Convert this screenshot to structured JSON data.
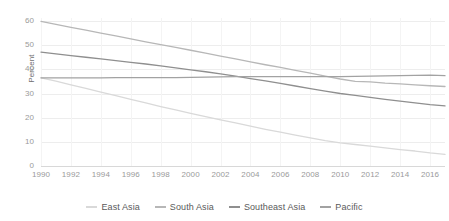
{
  "chart_data": {
    "type": "line",
    "title": "",
    "xlabel": "",
    "ylabel": "Percent",
    "xlim": [
      1990,
      2017
    ],
    "ylim": [
      0,
      60
    ],
    "grid": true,
    "legend_position": "bottom",
    "x_ticks": [
      "1990",
      "1992",
      "1994",
      "1996",
      "1998",
      "2000",
      "2002",
      "2004",
      "2006",
      "2008",
      "2010",
      "2012",
      "2014",
      "2016"
    ],
    "y_ticks": [
      "0",
      "10",
      "20",
      "30",
      "40",
      "50",
      "60"
    ],
    "x": [
      1990,
      1991,
      1992,
      1993,
      1994,
      1995,
      1996,
      1997,
      1998,
      1999,
      2000,
      2001,
      2002,
      2003,
      2004,
      2005,
      2006,
      2007,
      2008,
      2009,
      2010,
      2011,
      2012,
      2013,
      2014,
      2015,
      2016,
      2017
    ],
    "series": [
      {
        "name": "East Asia",
        "color": "#d9d9d9",
        "values": [
          36.5,
          35.1,
          33.6,
          32.1,
          30.6,
          29.1,
          27.6,
          26.1,
          24.6,
          23.2,
          21.8,
          20.4,
          19.1,
          17.8,
          16.5,
          15.2,
          14.0,
          12.8,
          11.6,
          10.5,
          9.6,
          8.9,
          8.2,
          7.5,
          6.8,
          6.2,
          5.4,
          4.8
        ]
      },
      {
        "name": "South Asia",
        "color": "#b7b7b7",
        "values": [
          59.8,
          58.6,
          57.4,
          56.2,
          55.0,
          53.8,
          52.6,
          51.4,
          50.2,
          49.1,
          47.9,
          46.7,
          45.5,
          44.3,
          43.1,
          41.9,
          40.8,
          39.6,
          38.4,
          37.2,
          36.0,
          35.0,
          34.8,
          34.3,
          34.0,
          33.6,
          33.2,
          32.9
        ]
      },
      {
        "name": "Southeast Asia",
        "color": "#8f8f8f",
        "values": [
          47.1,
          46.4,
          45.7,
          45.0,
          44.3,
          43.6,
          42.9,
          42.2,
          41.4,
          40.6,
          39.8,
          39.0,
          38.1,
          37.2,
          36.2,
          35.2,
          34.2,
          33.1,
          32.0,
          31.0,
          30.0,
          29.2,
          28.4,
          27.6,
          26.8,
          26.1,
          25.4,
          24.9
        ]
      },
      {
        "name": "Pacific",
        "color": "#a2a2a2",
        "values": [
          36.5,
          36.5,
          36.5,
          36.5,
          36.5,
          36.6,
          36.6,
          36.6,
          36.6,
          36.6,
          36.7,
          36.8,
          36.9,
          37.0,
          37.0,
          37.0,
          37.0,
          37.0,
          37.0,
          37.0,
          37.0,
          37.1,
          37.2,
          37.3,
          37.4,
          37.5,
          37.6,
          37.4
        ]
      }
    ]
  }
}
